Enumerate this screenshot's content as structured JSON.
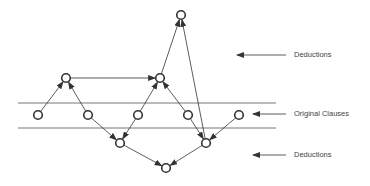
{
  "diagram": {
    "colors": {
      "stroke": "#333333",
      "band_line": "#777777",
      "node_fill": "#ffffff",
      "text": "#444444"
    },
    "labels": [
      {
        "id": "upper-deductions",
        "text": "Deductions",
        "x": 294,
        "y": 51,
        "arrow": {
          "x1": 286,
          "x2": 237,
          "y": 55
        }
      },
      {
        "id": "original-clauses",
        "text": "Original Clauses",
        "x": 294,
        "y": 110,
        "arrow": {
          "x1": 286,
          "x2": 253,
          "y": 114
        }
      },
      {
        "id": "lower-deductions",
        "text": "Deductions",
        "x": 294,
        "y": 151,
        "arrow": {
          "x1": 286,
          "x2": 253,
          "y": 155
        }
      }
    ],
    "band_lines": [
      {
        "y": 103,
        "x1": 18,
        "x2": 276
      },
      {
        "y": 128,
        "x1": 18,
        "x2": 276
      }
    ],
    "nodes": [
      {
        "id": "top",
        "x": 181,
        "y": 15,
        "level": "upper-deduction"
      },
      {
        "id": "u1",
        "x": 66,
        "y": 78,
        "level": "upper-deduction"
      },
      {
        "id": "u2",
        "x": 160,
        "y": 78,
        "level": "upper-deduction"
      },
      {
        "id": "c1",
        "x": 38,
        "y": 115,
        "level": "original-clause"
      },
      {
        "id": "c2",
        "x": 88,
        "y": 115,
        "level": "original-clause"
      },
      {
        "id": "c3",
        "x": 138,
        "y": 115,
        "level": "original-clause"
      },
      {
        "id": "c4",
        "x": 188,
        "y": 115,
        "level": "original-clause"
      },
      {
        "id": "c5",
        "x": 239,
        "y": 115,
        "level": "original-clause"
      },
      {
        "id": "l1",
        "x": 120,
        "y": 143,
        "level": "lower-deduction"
      },
      {
        "id": "l2",
        "x": 206,
        "y": 143,
        "level": "lower-deduction"
      },
      {
        "id": "bottom",
        "x": 166,
        "y": 168,
        "level": "lower-deduction"
      }
    ],
    "edges": [
      {
        "from": "c1",
        "to": "u1"
      },
      {
        "from": "c2",
        "to": "u1"
      },
      {
        "from": "c3",
        "to": "u2"
      },
      {
        "from": "c4",
        "to": "u2"
      },
      {
        "from": "u1",
        "to": "u2"
      },
      {
        "from": "u2",
        "to": "top"
      },
      {
        "from": "l2",
        "to": "top"
      },
      {
        "from": "c2",
        "to": "l1"
      },
      {
        "from": "c3",
        "to": "l1"
      },
      {
        "from": "c4",
        "to": "l2"
      },
      {
        "from": "c5",
        "to": "l2"
      },
      {
        "from": "l1",
        "to": "bottom"
      },
      {
        "from": "l2",
        "to": "bottom"
      }
    ]
  }
}
